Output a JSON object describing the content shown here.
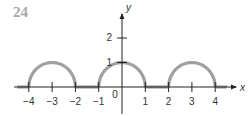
{
  "problem_number": "24",
  "chart_data": {
    "type": "line",
    "title": "",
    "xlabel": "x",
    "ylabel": "y",
    "xlim": [
      -4.5,
      4.7
    ],
    "ylim": [
      -1,
      2.8
    ],
    "x_ticks": [
      -4,
      -3,
      -2,
      -1,
      0,
      1,
      2,
      3,
      4
    ],
    "x_tick_labels": [
      "−4",
      "−3",
      "−2",
      "−1",
      "0",
      "1",
      "2",
      "3",
      "4"
    ],
    "y_ticks": [
      1,
      2
    ],
    "y_tick_labels": [
      "1",
      "2"
    ],
    "grid": false,
    "legend": null,
    "series": [
      {
        "name": "f(x)",
        "description": "Semicircular-like arches of height 1 on [-4,-2], [-1,1], [2,4]; zero elsewhere",
        "segments": [
          {
            "x": [
              -4,
              -3.5,
              -3,
              -2.5,
              -2
            ],
            "y": [
              0,
              0.87,
              1,
              0.87,
              0
            ]
          },
          {
            "x": [
              -1,
              -0.5,
              0,
              0.5,
              1
            ],
            "y": [
              0,
              0.87,
              1,
              0.87,
              0
            ]
          },
          {
            "x": [
              2,
              2.5,
              3,
              3.5,
              4
            ],
            "y": [
              0,
              0.87,
              1,
              0.87,
              0
            ]
          }
        ],
        "zero_intervals": [
          [
            -4.5,
            -4
          ],
          [
            -2,
            -1
          ],
          [
            1,
            2
          ],
          [
            4,
            4.5
          ]
        ],
        "color": "#a0a0a0"
      }
    ],
    "axis_color": "#222222"
  }
}
